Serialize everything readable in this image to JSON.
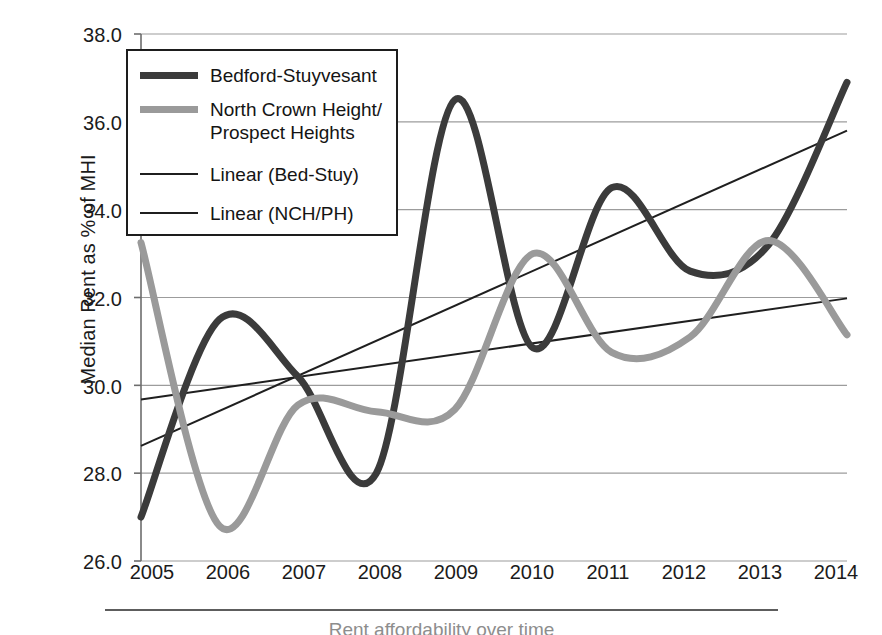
{
  "chart_data": {
    "type": "line",
    "title": "",
    "xlabel": "",
    "ylabel": "Median Rent as % of MHI",
    "x": [
      2005,
      2006,
      2007,
      2008,
      2009,
      2010,
      2011,
      2012,
      2013,
      2014
    ],
    "xtick_labels": [
      "2005",
      "2006",
      "2007",
      "2008",
      "2009",
      "2010",
      "2011",
      "2012",
      "2013",
      "2014"
    ],
    "ytick_labels": [
      "38.0",
      "36.0",
      "34.0",
      "32.0",
      "30.0",
      "28.0",
      "26.0"
    ],
    "ytick_values": [
      38.0,
      36.0,
      34.0,
      32.0,
      30.0,
      28.0,
      26.0
    ],
    "ylim": [
      26.0,
      38.0
    ],
    "xlim": [
      2005,
      2014
    ],
    "grid": "horizontal",
    "legend_position": "upper-left",
    "series": [
      {
        "name": "Bedford-Stuyvesant",
        "key": "bed_stuy",
        "style": "smooth-thick",
        "color": "#3b3b3b",
        "width": 7,
        "values": [
          27.0,
          31.5,
          30.2,
          28.0,
          36.5,
          30.85,
          34.5,
          32.6,
          33.2,
          36.9
        ]
      },
      {
        "name": "North Crown Height/\nProspect Heights",
        "key": "nch_ph",
        "style": "smooth-thick",
        "color": "#9a9a9a",
        "width": 7,
        "values": [
          33.25,
          26.8,
          29.55,
          29.4,
          29.45,
          33.0,
          30.75,
          31.1,
          33.3,
          31.15
        ]
      },
      {
        "name": "Linear (Bed-Stuy)",
        "key": "trend_bed_stuy",
        "style": "straight-thin",
        "color": "#1f1f1f",
        "width": 2,
        "endpoints": [
          28.62,
          35.8
        ]
      },
      {
        "name": "Linear (NCH/PH)",
        "key": "trend_nch_ph",
        "style": "straight-thin",
        "color": "#1f1f1f",
        "width": 2,
        "endpoints": [
          29.68,
          31.98
        ]
      }
    ]
  },
  "legend": {
    "items": [
      {
        "label": "Bedford-Stuyvesant",
        "swatch": "thick-dark"
      },
      {
        "label": "North Crown Height/\nProspect Heights",
        "swatch": "thick-gray"
      },
      {
        "label": "Linear (Bed-Stuy)",
        "swatch": "thin-dark"
      },
      {
        "label": "Linear (NCH/PH)",
        "swatch": "thin-dark"
      }
    ]
  },
  "caption": {
    "text": "Rent affordability over time"
  },
  "colors": {
    "series_dark": "#3b3b3b",
    "series_gray": "#9a9a9a",
    "trendline": "#1f1f1f",
    "gridline": "#9c9c9c",
    "axis": "#6d6d6d",
    "text": "#1b1b1b",
    "background": "#ffffff"
  }
}
